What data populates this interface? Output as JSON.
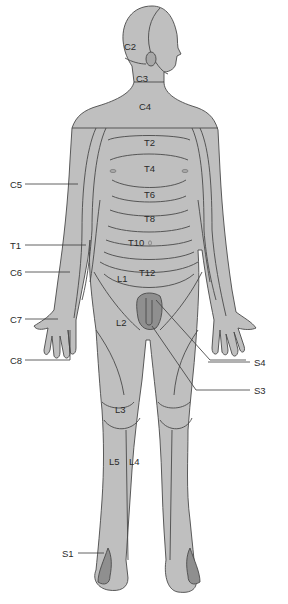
{
  "figure": {
    "colors": {
      "skin": "#bfbfbf",
      "dark_region": "#8f8f8f",
      "outline": "#4a4a4a",
      "background": "#ffffff"
    }
  },
  "labels": {
    "head": {
      "c2": "C2",
      "c3": "C3",
      "c4": "C4"
    },
    "trunk": {
      "t2": "T2",
      "t4": "T4",
      "t6": "T6",
      "t8": "T8",
      "t10": "T10",
      "t12": "T12"
    },
    "arm": {
      "c5": "C5",
      "t1": "T1",
      "c6": "C6",
      "c7": "C7",
      "c8": "C8"
    },
    "leg": {
      "l1": "L1",
      "l2": "L2",
      "l3": "L3",
      "l4": "L4",
      "l5": "L5",
      "s1": "S1",
      "s3": "S3",
      "s4": "S4"
    }
  }
}
